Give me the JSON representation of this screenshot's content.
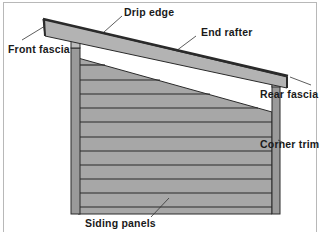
{
  "diagram": {
    "labels": {
      "drip_edge": "Drip edge",
      "front_fascia": "Front fascia",
      "end_rafter": "End rafter",
      "rear_fascia": "Rear fascia",
      "corner_trim": "Corner trim",
      "siding_panels": "Siding panels"
    },
    "colors": {
      "siding": "#a7a7a7",
      "trim": "#9a9a9a",
      "rafter": "#b3b3b3",
      "lines": "#2a2a2a",
      "frame": "#b8b8b8"
    },
    "siding_line_count": 11
  }
}
